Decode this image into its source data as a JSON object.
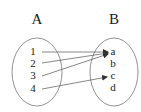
{
  "diagram": {
    "type": "function-mapping",
    "sets": [
      {
        "name": "A",
        "elements": [
          "1",
          "2",
          "3",
          "4"
        ]
      },
      {
        "name": "B",
        "elements": [
          "a",
          "b",
          "c",
          "d"
        ]
      }
    ],
    "mappings": [
      {
        "from": "1",
        "to": "a"
      },
      {
        "from": "2",
        "to": "a"
      },
      {
        "from": "3",
        "to": "a"
      },
      {
        "from": "4",
        "to": "c"
      }
    ],
    "colors": {
      "stroke": "#555555",
      "text": "#222222",
      "background": "#ffffff"
    }
  }
}
